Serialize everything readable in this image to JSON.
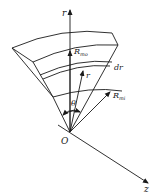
{
  "diagram": {
    "type": "cylindrical-sector-element",
    "labels": {
      "r_axis": "r",
      "z_axis": "z",
      "origin": "O",
      "theta": "θ",
      "r_vector": "r",
      "dr": "dr",
      "r_outer": "R",
      "r_outer_sub": "mo",
      "r_inner": "R",
      "r_inner_sub": "mi"
    },
    "colors": {
      "stroke": "#1a1a1a",
      "background": "#ffffff"
    }
  }
}
